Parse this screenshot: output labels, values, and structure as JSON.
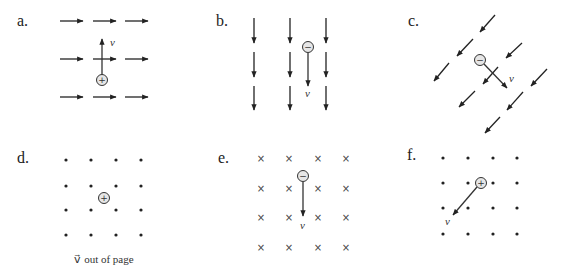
{
  "panels": [
    {
      "id": "a",
      "label": "a.",
      "field": "right",
      "charge": "+",
      "velocity": "up",
      "velocity_label": "v⃗"
    },
    {
      "id": "b",
      "label": "b.",
      "field": "down",
      "charge": "−",
      "velocity": "down",
      "velocity_label": "v⃗"
    },
    {
      "id": "c",
      "label": "c.",
      "field": "down-left",
      "charge": "−",
      "velocity": "down-right",
      "velocity_label": "v⃗"
    },
    {
      "id": "d",
      "label": "d.",
      "field": "out of page (dots)",
      "charge": "+",
      "velocity": "out of page",
      "caption": "v⃗ out of page"
    },
    {
      "id": "e",
      "label": "e.",
      "field": "into page (crosses)",
      "charge": "−",
      "velocity": "down",
      "velocity_label": "v⃗"
    },
    {
      "id": "f",
      "label": "f.",
      "field": "out of page (dots)",
      "charge": "+",
      "velocity": "down-left",
      "velocity_label": "v⃗"
    }
  ],
  "symbols": {
    "field_out": "•",
    "field_in": "×",
    "positive": "+",
    "negative": "−"
  },
  "colors": {
    "ink": "#222222",
    "charge_fill": "#e6e6e6",
    "background": "#ffffff"
  }
}
